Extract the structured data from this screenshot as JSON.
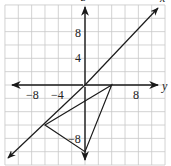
{
  "figure": {
    "type": "coordinate-plane",
    "grid": {
      "spacing_units": 2,
      "range_x": [
        -12,
        12
      ],
      "range_y": [
        -12,
        12
      ],
      "color": "#c8c8c8"
    },
    "axes": {
      "horizontal_label": "y",
      "vertical_label": "z",
      "diagonal_label": "x",
      "horizontal_ticks": [
        {
          "value": -8,
          "label": "−8"
        },
        {
          "value": -4,
          "label": "−4"
        },
        {
          "value": 8,
          "label": "8"
        }
      ],
      "vertical_ticks": [
        {
          "value": 8,
          "label": "8"
        },
        {
          "value": 4,
          "label": "4"
        },
        {
          "value": -8,
          "label": "−8"
        }
      ]
    },
    "triangle": {
      "vertices": [
        {
          "name": "A",
          "coords": [
            4,
            0
          ]
        },
        {
          "name": "B",
          "coords": [
            -6,
            -6
          ]
        },
        {
          "name": "C",
          "coords": [
            0,
            -10
          ]
        }
      ]
    },
    "line_color": "#1a1a1a"
  }
}
